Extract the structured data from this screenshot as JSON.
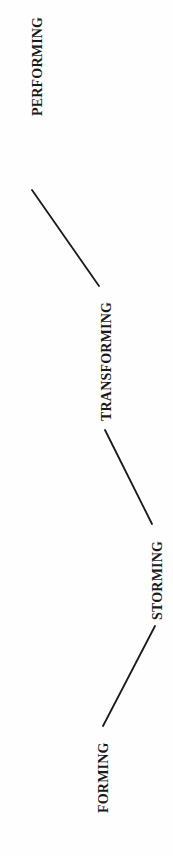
{
  "diagram": {
    "orientation": "rotated-90-ccw",
    "background_color": "#fefefe",
    "line_color": "#1a1a1a",
    "text_color": "#1a1a1a",
    "stages": [
      {
        "id": "performing",
        "label": "PERFORMING",
        "order": 4,
        "anchor_x": 39,
        "anchor_y": 117,
        "text_left": 30,
        "text_bottom": 116,
        "font_size": 14
      },
      {
        "id": "transforming",
        "label": "TRANSFORMING",
        "order": 3,
        "anchor_x": 107,
        "anchor_y": 424,
        "text_left": 99,
        "text_bottom": 421,
        "font_size": 14
      },
      {
        "id": "storming",
        "label": "STORMING",
        "order": 2,
        "anchor_x": 158,
        "anchor_y": 621,
        "text_left": 150,
        "text_bottom": 620,
        "font_size": 14
      },
      {
        "id": "forming",
        "label": "FORMING",
        "order": 1,
        "anchor_x": 105,
        "anchor_y": 814,
        "text_left": 96,
        "text_bottom": 813,
        "font_size": 14
      }
    ],
    "connectors": [
      {
        "id": "performing-transforming",
        "from": "performing",
        "to": "transforming",
        "x1": 32,
        "y1": 190,
        "x2": 99,
        "y2": 286,
        "stroke_width": 1.8
      },
      {
        "id": "transforming-storming",
        "from": "transforming",
        "to": "storming",
        "x1": 105,
        "y1": 430,
        "x2": 152,
        "y2": 524,
        "stroke_width": 1.8
      },
      {
        "id": "storming-forming",
        "from": "storming",
        "to": "forming",
        "x1": 155,
        "y1": 626,
        "x2": 103,
        "y2": 726,
        "stroke_width": 1.8
      }
    ]
  }
}
